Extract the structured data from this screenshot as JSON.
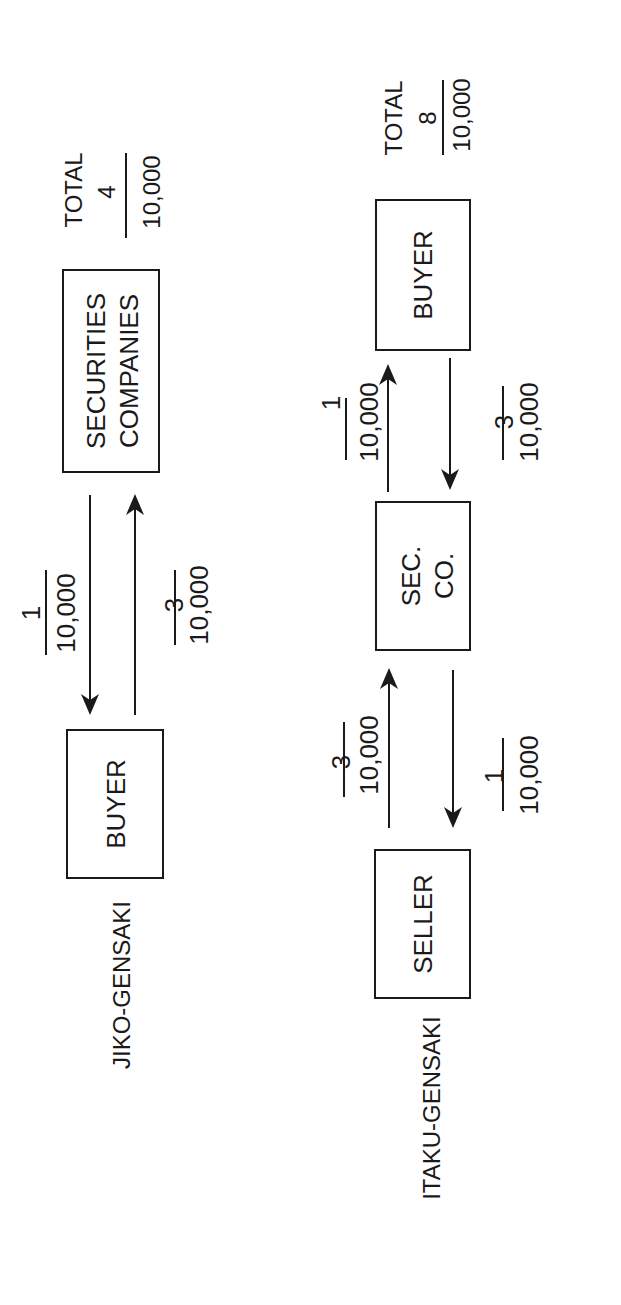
{
  "colors": {
    "ink": "#1a1a1a",
    "background": "#ffffff"
  },
  "diagrams": [
    {
      "label": "JIKO-GENSAKI",
      "nodes": [
        {
          "id": "buyer",
          "lines": [
            "BUYER"
          ]
        },
        {
          "id": "securities",
          "lines": [
            "SECURITIES",
            "COMPANIES"
          ]
        }
      ],
      "flows": [
        {
          "from": "securities",
          "to": "buyer",
          "numerator": "1",
          "denominator": "10,000"
        },
        {
          "from": "buyer",
          "to": "securities",
          "numerator": "3",
          "denominator": "10,000"
        }
      ],
      "total": {
        "label": "TOTAL",
        "numerator": "4",
        "denominator": "10,000"
      }
    },
    {
      "label": "ITAKU-GENSAKI",
      "nodes": [
        {
          "id": "seller",
          "lines": [
            "SELLER"
          ]
        },
        {
          "id": "secco",
          "lines": [
            "SEC.",
            "CO."
          ]
        },
        {
          "id": "buyer",
          "lines": [
            "BUYER"
          ]
        }
      ],
      "flows": [
        {
          "from": "seller",
          "to": "secco",
          "numerator": "3",
          "denominator": "10,000"
        },
        {
          "from": "secco",
          "to": "seller",
          "numerator": "1",
          "denominator": "10,000"
        },
        {
          "from": "secco",
          "to": "buyer",
          "numerator": "1",
          "denominator": "10,000"
        },
        {
          "from": "buyer",
          "to": "secco",
          "numerator": "3",
          "denominator": "10,000"
        }
      ],
      "total": {
        "label": "TOTAL",
        "numerator": "8",
        "denominator": "10,000"
      }
    }
  ]
}
